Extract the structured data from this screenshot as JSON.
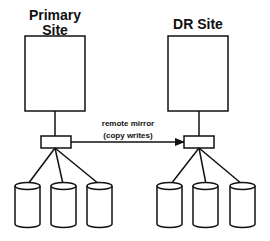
{
  "diagram": {
    "primary_site": {
      "label_line1": "Primary",
      "label_line2": "Site",
      "disk_count": 3
    },
    "dr_site": {
      "label": "DR Site",
      "disk_count": 3
    },
    "link": {
      "label_line1": "remote mirror",
      "label_line2": "(copy writes)",
      "direction": "primary-to-dr"
    },
    "colors": {
      "stroke": "#111111",
      "fill": "#ffffff"
    }
  }
}
